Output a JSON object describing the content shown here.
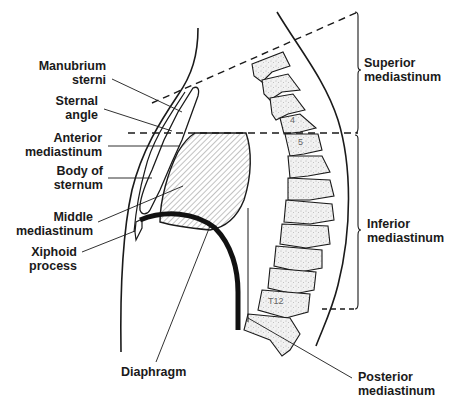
{
  "labels": {
    "manubrium_sterni": {
      "line1": "Manubrium",
      "line2": "sterni"
    },
    "sternal_angle": {
      "line1": "Sternal",
      "line2": "angle"
    },
    "anterior_mediastinum": {
      "line1": "Anterior",
      "line2": "mediastinum"
    },
    "body_of_sternum": {
      "line1": "Body of",
      "line2": "sternum"
    },
    "middle_mediastinum": {
      "line1": "Middle",
      "line2": "mediastinum"
    },
    "xiphoid_process": {
      "line1": "Xiphoid",
      "line2": "process"
    },
    "diaphragm": {
      "line1": "Diaphragm"
    },
    "superior_mediastinum": {
      "line1": "Superior",
      "line2": "mediastinum"
    },
    "inferior_mediastinum": {
      "line1": "Inferior",
      "line2": "mediastinum"
    },
    "posterior_mediastinum": {
      "line1": "Posterior",
      "line2": "mediastinum"
    }
  },
  "vertebra_labels": {
    "t4": "4",
    "t5": "5",
    "t12": "T12"
  },
  "colors": {
    "ink": "#1a1a1a",
    "stipple": "#e8e8e8",
    "hatch": "#555555",
    "background": "#ffffff"
  }
}
